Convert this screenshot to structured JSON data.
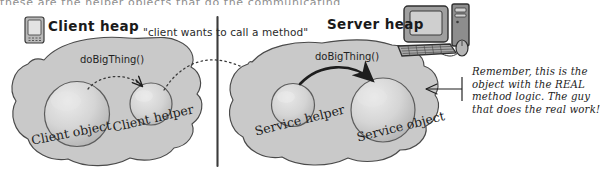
{
  "figure": {
    "type": "annotated-hand-drawn-diagram",
    "topic": "RMI client/server heap with helper objects",
    "cutoff_header": "these are the helper objects that do the communicating"
  },
  "divider": {
    "name": "vertical-separator",
    "color": "#3b3b3b"
  },
  "left_panel": {
    "icon": "handheld-device-icon",
    "title": "Client heap",
    "method_label": "doBigThing()",
    "objects": [
      {
        "label": "Client object"
      },
      {
        "label": "Client helper"
      }
    ]
  },
  "center": {
    "quote": "\"client wants to call a method\""
  },
  "right_panel": {
    "icon": "desktop-computer-icon",
    "title": "Server heap",
    "method_label": "doBigThing()",
    "objects": [
      {
        "label": "Service helper"
      },
      {
        "label": "Service object"
      }
    ]
  },
  "annotation": {
    "pointer": "callout-arrow",
    "lines": [
      "Remember, this is the",
      "object with the REAL",
      "method logic. The guy",
      "that does the real work!"
    ]
  },
  "colors": {
    "blob_fill": "#c9c9c9",
    "sphere_fill": "#d2d2d2",
    "ink": "#2b2b2b",
    "paper": "#ffffff"
  }
}
